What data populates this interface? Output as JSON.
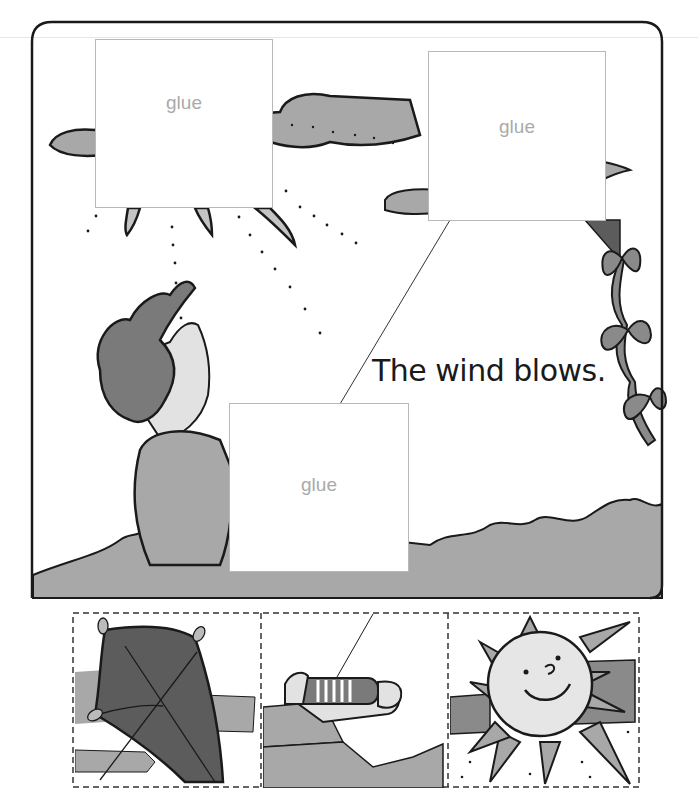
{
  "worksheet": {
    "sentence": "The wind blows.",
    "glue_boxes": [
      {
        "label": "glue",
        "position": "top-left"
      },
      {
        "label": "glue",
        "position": "top-right"
      },
      {
        "label": "glue",
        "position": "center"
      }
    ],
    "scene_elements": [
      "sun-peeking-behind-cloud",
      "clouds",
      "kite-tail-with-bows",
      "boy-with-windblown-hair",
      "grass-ground",
      "kite-string"
    ],
    "cutouts": [
      {
        "name": "kite",
        "description": "dark kite with string"
      },
      {
        "name": "hand-with-spool",
        "description": "arm holding kite string spool"
      },
      {
        "name": "sun",
        "description": "smiling sun with rays"
      }
    ]
  },
  "colors": {
    "frame": "#1a1a1a",
    "gray_fill": "#a8a8a8",
    "light_gray": "#d8d8d8",
    "dark_gray": "#5c5c5c",
    "glue_border": "#b8b8b8",
    "glue_text": "#aaaaaa"
  }
}
